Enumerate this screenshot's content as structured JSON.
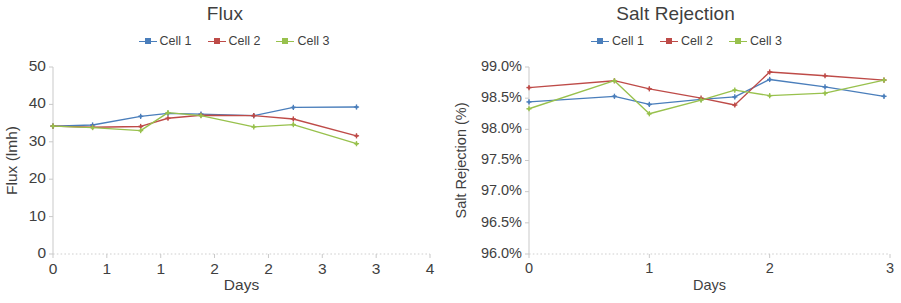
{
  "figure": {
    "background": "#ffffff",
    "series_colors": {
      "cell1": "#4a7ebb",
      "cell2": "#be4b48",
      "cell3": "#98c14d"
    },
    "axis_color": "#c9c9c9",
    "text_color": "#3f3f3f"
  },
  "legend": {
    "items": [
      {
        "label": "Cell 1",
        "color": "#4a7ebb",
        "marker": "plus-marker"
      },
      {
        "label": "Cell 2",
        "color": "#be4b48",
        "marker": "plus-marker"
      },
      {
        "label": "Cell 3",
        "color": "#98c14d",
        "marker": "plus-marker"
      }
    ]
  },
  "chart_data": [
    {
      "id": "flux",
      "type": "line",
      "title": "Flux",
      "xlabel": "Days",
      "ylabel": "Flux (lmh)",
      "xlim": [
        0,
        4
      ],
      "ylim": [
        0,
        50
      ],
      "xticks": [
        0,
        0.571,
        1.143,
        1.714,
        2.286,
        2.857,
        3.429,
        4
      ],
      "xticklabels": [
        "0",
        "1",
        "1",
        "2",
        "2",
        "3",
        "3",
        "4"
      ],
      "yticks": [
        0,
        10,
        20,
        30,
        40,
        50
      ],
      "yticklabels": [
        "0",
        "10",
        "20",
        "30",
        "40",
        "50"
      ],
      "grid": false,
      "legend_position": "top",
      "x": [
        0,
        0.62,
        1.02,
        1.5,
        2.15,
        2.55,
        3.22
      ],
      "series": [
        {
          "name": "Cell 1",
          "color": "#4a7ebb",
          "values": [
            34.2,
            34.5,
            36.8,
            37.6,
            37.4,
            37.0,
            39.2,
            39.3
          ]
        },
        {
          "name": "Cell 2",
          "color": "#be4b48",
          "values": [
            34.2,
            33.9,
            34.1,
            36.3,
            37.1,
            37.0,
            36.1,
            31.6
          ]
        },
        {
          "name": "Cell 3",
          "color": "#98c14d",
          "values": [
            34.2,
            33.8,
            33.0,
            37.8,
            37.0,
            34.0,
            34.6,
            29.5
          ]
        }
      ],
      "series_x": [
        0,
        0.42,
        0.93,
        1.22,
        1.57,
        2.13,
        2.55,
        3.22
      ]
    },
    {
      "id": "salt_rejection",
      "type": "line",
      "title": "Salt Rejection",
      "xlabel": "Days",
      "ylabel": "Salt Rejection (%)",
      "xlim": [
        0,
        3
      ],
      "ylim": [
        96.0,
        99.0
      ],
      "xticks": [
        0,
        1,
        2,
        3
      ],
      "xticklabels": [
        "0",
        "1",
        "2",
        "3"
      ],
      "yticks": [
        96.0,
        96.5,
        97.0,
        97.5,
        98.0,
        98.5,
        99.0
      ],
      "yticklabels": [
        "96.0%",
        "96.5%",
        "97.0%",
        "97.5%",
        "98.0%",
        "98.5%",
        "99.0%"
      ],
      "grid": false,
      "legend_position": "top",
      "x": [
        0,
        0.71,
        1.0,
        1.43,
        1.71,
        2.0,
        2.46,
        2.95
      ],
      "series": [
        {
          "name": "Cell 1",
          "color": "#4a7ebb",
          "values": [
            98.44,
            98.53,
            98.4,
            98.48,
            98.52,
            98.8,
            98.68,
            98.53
          ]
        },
        {
          "name": "Cell 2",
          "color": "#be4b48",
          "values": [
            98.67,
            98.78,
            98.65,
            98.5,
            98.39,
            98.92,
            98.86,
            98.79
          ]
        },
        {
          "name": "Cell 3",
          "color": "#98c14d",
          "values": [
            98.33,
            98.78,
            98.25,
            98.47,
            98.63,
            98.54,
            98.58,
            98.79
          ]
        }
      ]
    }
  ]
}
